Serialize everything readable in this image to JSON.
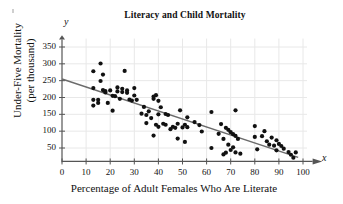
{
  "figure": {
    "title": "Literacy and Child Mortality",
    "x_axis_variable": "x",
    "y_axis_variable": "y",
    "background_color": "#ffffff",
    "point_color": "#111111",
    "line_color": "#6b6b6b",
    "grid_color": "#e8e8e8",
    "axis_color": "#555555"
  },
  "chart_data": {
    "type": "scatter",
    "title": "Literacy and Child Mortality",
    "xlabel": "Percentage of Adult Females Who Are Literate",
    "ylabel": "Under-Five Mortality (per thousand)",
    "ylabel_line1": "Under-Five Mortality",
    "ylabel_line2": "(per thousand)",
    "xlim": [
      0,
      100
    ],
    "ylim": [
      0,
      375
    ],
    "xticks": [
      0,
      10,
      20,
      30,
      40,
      50,
      60,
      70,
      80,
      90,
      100
    ],
    "xtick_labels": [
      "0",
      "10",
      "20",
      "30",
      "40",
      "50",
      "60",
      "70",
      "80",
      "90",
      "100"
    ],
    "yticks": [
      50,
      100,
      150,
      200,
      250,
      300,
      350
    ],
    "ytick_labels": [
      "50",
      "100",
      "150",
      "200",
      "250",
      "300",
      "350"
    ],
    "grid": true,
    "legend": null,
    "trendline": {
      "type": "line",
      "x": [
        0,
        98
      ],
      "y": [
        255,
        22
      ],
      "slope": -2.38,
      "intercept": 255
    },
    "points": [
      [
        13,
        278
      ],
      [
        13,
        228
      ],
      [
        13,
        193
      ],
      [
        13,
        176
      ],
      [
        15,
        193
      ],
      [
        15,
        184
      ],
      [
        16,
        249
      ],
      [
        16,
        301
      ],
      [
        17,
        268
      ],
      [
        17,
        222
      ],
      [
        18,
        219
      ],
      [
        18,
        215
      ],
      [
        19,
        184
      ],
      [
        20,
        221
      ],
      [
        21,
        205
      ],
      [
        21,
        161
      ],
      [
        22,
        204
      ],
      [
        23,
        230
      ],
      [
        23,
        218
      ],
      [
        24,
        196
      ],
      [
        25,
        226
      ],
      [
        25,
        216
      ],
      [
        26,
        279
      ],
      [
        27,
        221
      ],
      [
        27,
        214
      ],
      [
        28,
        194
      ],
      [
        29,
        191
      ],
      [
        30,
        228
      ],
      [
        30,
        206
      ],
      [
        31,
        193
      ],
      [
        33,
        152
      ],
      [
        34,
        172
      ],
      [
        35,
        148
      ],
      [
        35,
        124
      ],
      [
        36,
        159
      ],
      [
        37,
        139
      ],
      [
        38,
        203
      ],
      [
        38,
        196
      ],
      [
        38,
        87
      ],
      [
        39,
        207
      ],
      [
        39,
        119
      ],
      [
        40,
        190
      ],
      [
        40,
        150
      ],
      [
        40,
        113
      ],
      [
        41,
        171
      ],
      [
        42,
        122
      ],
      [
        43,
        151
      ],
      [
        43,
        119
      ],
      [
        44,
        148
      ],
      [
        45,
        106
      ],
      [
        46,
        113
      ],
      [
        47,
        110
      ],
      [
        48,
        122
      ],
      [
        48,
        78
      ],
      [
        49,
        162
      ],
      [
        50,
        111
      ],
      [
        51,
        119
      ],
      [
        51,
        68
      ],
      [
        52,
        112
      ],
      [
        52,
        141
      ],
      [
        55,
        127
      ],
      [
        57,
        118
      ],
      [
        58,
        99
      ],
      [
        62,
        157
      ],
      [
        62,
        50
      ],
      [
        65,
        92
      ],
      [
        66,
        121
      ],
      [
        67,
        77
      ],
      [
        67,
        31
      ],
      [
        68,
        110
      ],
      [
        68,
        36
      ],
      [
        69,
        104
      ],
      [
        69,
        60
      ],
      [
        70,
        97
      ],
      [
        70,
        44
      ],
      [
        71,
        91
      ],
      [
        71,
        52
      ],
      [
        72,
        162
      ],
      [
        72,
        86
      ],
      [
        72,
        37
      ],
      [
        73,
        77
      ],
      [
        74,
        33
      ],
      [
        80,
        115
      ],
      [
        80,
        83
      ],
      [
        81,
        46
      ],
      [
        83,
        85
      ],
      [
        84,
        100
      ],
      [
        85,
        70
      ],
      [
        86,
        60
      ],
      [
        87,
        81
      ],
      [
        88,
        57
      ],
      [
        89,
        73
      ],
      [
        89,
        43
      ],
      [
        90,
        62
      ],
      [
        91,
        56
      ],
      [
        92,
        48
      ],
      [
        94,
        38
      ],
      [
        95,
        30
      ],
      [
        96,
        21
      ],
      [
        97,
        37
      ]
    ]
  }
}
